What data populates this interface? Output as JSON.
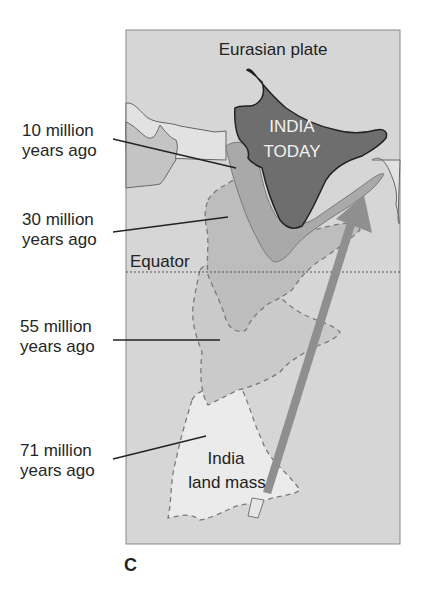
{
  "figure": {
    "panel_letter": "C",
    "plate_label": "Eurasian plate",
    "india_today_line1": "INDIA",
    "india_today_line2": "TODAY",
    "equator_label": "Equator",
    "landmass_line1": "India",
    "landmass_line2": "land mass"
  },
  "timeline_labels": [
    {
      "line1": "10 million",
      "line2": "years ago"
    },
    {
      "line1": "30 million",
      "line2": "years ago"
    },
    {
      "line1": "55 million",
      "line2": "years ago"
    },
    {
      "line1": "71 million",
      "line2": "years ago"
    }
  ],
  "colors": {
    "background": "#d6d6d6",
    "india_today": "#6e6e6e",
    "pos_10": "#a9a9a9",
    "pos_30": "#bdbdbd",
    "pos_55": "#cacaca",
    "pos_71": "#e6e6e6",
    "arrow": "#8f8f8f"
  }
}
